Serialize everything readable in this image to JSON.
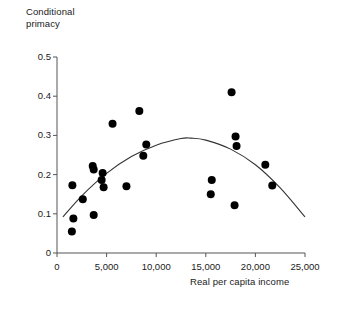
{
  "chart_data": {
    "type": "scatter",
    "title": "",
    "subtitle": "",
    "xlabel": "Real per capita income",
    "ylabel": "Conditional primacy",
    "xlim": [
      0,
      25000
    ],
    "ylim": [
      0,
      0.5
    ],
    "xticks": [
      0,
      5000,
      10000,
      15000,
      20000,
      25000
    ],
    "xticklabels": [
      "0",
      "5,000",
      "10,000",
      "15,000",
      "20,000",
      "25,000"
    ],
    "yticks": [
      0,
      0.1,
      0.2,
      0.3,
      0.4,
      0.5
    ],
    "yticklabels": [
      "0",
      "0.1",
      "0.2",
      "0.3",
      "0.4",
      "0.5"
    ],
    "grid": false,
    "legend": false,
    "marker": "filled-circle",
    "marker_color": "#000000",
    "marker_size": 5.4,
    "points": [
      {
        "x": 1500,
        "y": 0.055
      },
      {
        "x": 1650,
        "y": 0.088
      },
      {
        "x": 1550,
        "y": 0.173
      },
      {
        "x": 2600,
        "y": 0.137
      },
      {
        "x": 3700,
        "y": 0.097
      },
      {
        "x": 3600,
        "y": 0.222
      },
      {
        "x": 3700,
        "y": 0.213
      },
      {
        "x": 4600,
        "y": 0.204
      },
      {
        "x": 4500,
        "y": 0.186
      },
      {
        "x": 4700,
        "y": 0.168
      },
      {
        "x": 5600,
        "y": 0.33
      },
      {
        "x": 7000,
        "y": 0.17
      },
      {
        "x": 8300,
        "y": 0.362
      },
      {
        "x": 8700,
        "y": 0.248
      },
      {
        "x": 9000,
        "y": 0.277
      },
      {
        "x": 15600,
        "y": 0.186
      },
      {
        "x": 15500,
        "y": 0.15
      },
      {
        "x": 17600,
        "y": 0.41
      },
      {
        "x": 17900,
        "y": 0.122
      },
      {
        "x": 18000,
        "y": 0.297
      },
      {
        "x": 18100,
        "y": 0.273
      },
      {
        "x": 21000,
        "y": 0.225
      },
      {
        "x": 21700,
        "y": 0.172
      }
    ],
    "fit_curve": {
      "name": "quadratic-fit",
      "description": "inverted-U regression curve",
      "color": "#333333",
      "points": [
        {
          "x": 600,
          "y": 0.092
        },
        {
          "x": 2500,
          "y": 0.146
        },
        {
          "x": 5000,
          "y": 0.203
        },
        {
          "x": 7500,
          "y": 0.246
        },
        {
          "x": 10000,
          "y": 0.275
        },
        {
          "x": 12500,
          "y": 0.292
        },
        {
          "x": 13500,
          "y": 0.293
        },
        {
          "x": 15000,
          "y": 0.288
        },
        {
          "x": 17500,
          "y": 0.265
        },
        {
          "x": 20000,
          "y": 0.225
        },
        {
          "x": 22500,
          "y": 0.166
        },
        {
          "x": 25000,
          "y": 0.092
        }
      ]
    }
  },
  "axes": {
    "y_title": "Conditional\nprimacy",
    "x_title": "Real per capita income",
    "axis_color": "#555555"
  }
}
